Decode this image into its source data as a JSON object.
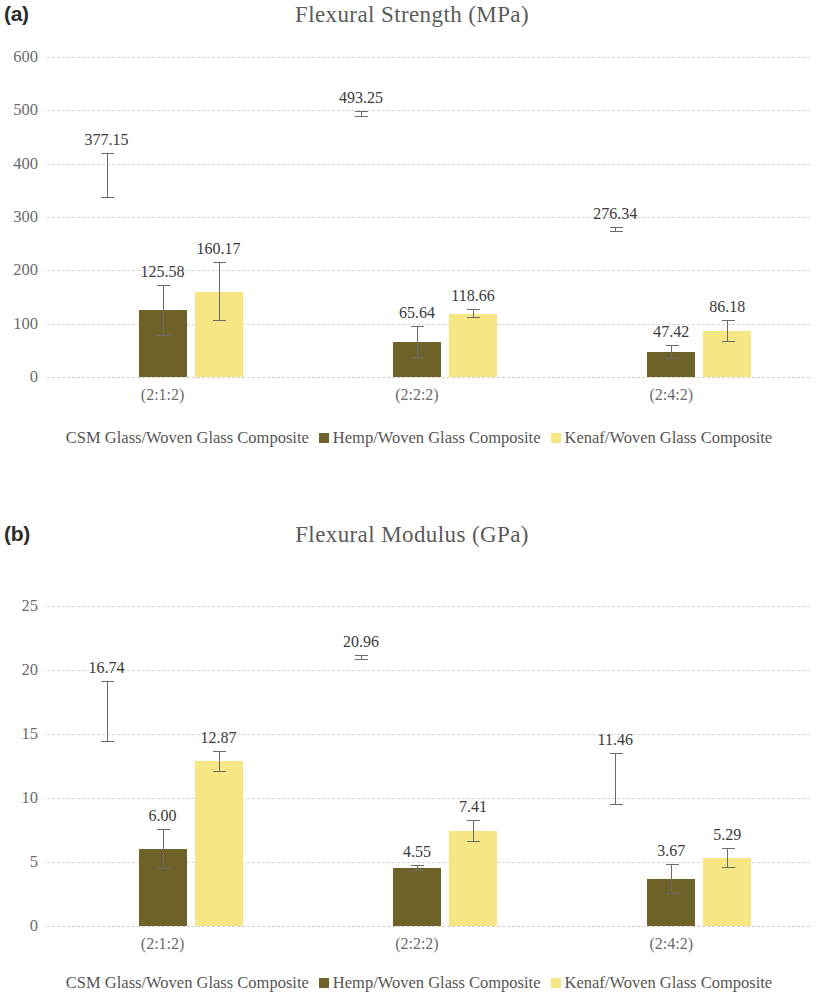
{
  "figure": {
    "panels": [
      {
        "label": "(a)",
        "title": "Flexural Strength (MPa)"
      },
      {
        "label": "(b)",
        "title": "Flexural Modulus (GPa)"
      }
    ],
    "legend_labels": [
      "CSM Glass/Woven Glass Composite",
      "Hemp/Woven Glass Composite",
      "Kenaf/Woven Glass Composite"
    ],
    "colors": {
      "csm": "#ffffff",
      "hemp": "#6e6228",
      "kenaf": "#f7e784",
      "error_bar": "#6b6b6b",
      "gridline": "#d8d8d8",
      "title_text": "#5a5a5a",
      "tick_text": "#6a6a6a"
    }
  },
  "chart_data": [
    {
      "type": "bar",
      "title": "Flexural Strength (MPa)",
      "panel": "(a)",
      "xlabel": "",
      "ylabel": "Flexural Strength (MPa)",
      "ylim": [
        0,
        600
      ],
      "yticks": [
        0,
        100,
        200,
        300,
        400,
        500,
        600
      ],
      "ytick_labels": [
        "0",
        "100",
        "200",
        "300",
        "400",
        "500",
        "600"
      ],
      "grid": true,
      "legend_position": "bottom",
      "categories": [
        "(2:1:2)",
        "(2:2:2)",
        "(2:4:2)"
      ],
      "series": [
        {
          "name": "CSM Glass/Woven Glass Composite",
          "color": "#ffffff",
          "values": [
            377.15,
            493.25,
            276.34
          ],
          "labels": [
            "377.15",
            "493.25",
            "276.34"
          ],
          "err_low": [
            335.0,
            488.0,
            271.0
          ],
          "err_high": [
            420.0,
            498.0,
            281.0
          ]
        },
        {
          "name": "Hemp/Woven Glass Composite",
          "color": "#6e6228",
          "values": [
            125.58,
            65.64,
            47.42
          ],
          "labels": [
            "125.58",
            "65.64",
            "47.42"
          ],
          "err_low": [
            77.0,
            36.0,
            34.0
          ],
          "err_high": [
            173.0,
            95.0,
            60.0
          ]
        },
        {
          "name": "Kenaf/Woven Glass Composite",
          "color": "#f7e784",
          "values": [
            160.17,
            118.66,
            86.18
          ],
          "labels": [
            "160.17",
            "118.66",
            "86.18"
          ],
          "err_low": [
            105.0,
            110.0,
            65.0
          ],
          "err_high": [
            215.0,
            127.0,
            107.0
          ]
        }
      ]
    },
    {
      "type": "bar",
      "title": "Flexural Modulus (GPa)",
      "panel": "(b)",
      "xlabel": "",
      "ylabel": "Flexural Modulus (GPa)",
      "ylim": [
        0,
        25
      ],
      "yticks": [
        0,
        5,
        10,
        15,
        20,
        25
      ],
      "ytick_labels": [
        "0",
        "5",
        "10",
        "15",
        "20",
        "25"
      ],
      "grid": true,
      "legend_position": "bottom",
      "categories": [
        "(2:1:2)",
        "(2:2:2)",
        "(2:4:2)"
      ],
      "series": [
        {
          "name": "CSM Glass/Woven Glass Composite",
          "color": "#ffffff",
          "values": [
            16.74,
            20.96,
            11.46
          ],
          "labels": [
            "16.74",
            "20.96",
            "11.46"
          ],
          "err_low": [
            14.35,
            20.75,
            9.45
          ],
          "err_high": [
            19.15,
            21.2,
            13.5
          ]
        },
        {
          "name": "Hemp/Woven Glass Composite",
          "color": "#6e6228",
          "values": [
            6.0,
            4.55,
            3.67
          ],
          "labels": [
            "6.00",
            "4.55",
            "3.67"
          ],
          "err_low": [
            4.45,
            4.3,
            2.5
          ],
          "err_high": [
            7.6,
            4.8,
            4.85
          ]
        },
        {
          "name": "Kenaf/Woven Glass Composite",
          "color": "#f7e784",
          "values": [
            12.87,
            7.41,
            5.29
          ],
          "labels": [
            "12.87",
            "7.41",
            "5.29"
          ],
          "err_low": [
            12.05,
            6.6,
            4.5
          ],
          "err_high": [
            13.7,
            8.25,
            6.1
          ]
        }
      ]
    }
  ]
}
